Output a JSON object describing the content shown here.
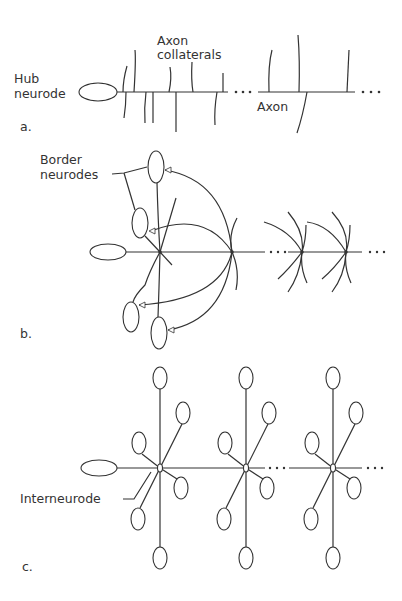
{
  "figure": {
    "panels": [
      {
        "id": "a",
        "label": "a.",
        "annotations": {
          "hub": [
            "Hub",
            "neurode"
          ],
          "collaterals": [
            "Axon",
            "collaterals"
          ],
          "axon": "Axon"
        }
      },
      {
        "id": "b",
        "label": "b.",
        "annotations": {
          "border": [
            "Border",
            "neurodes"
          ]
        }
      },
      {
        "id": "c",
        "label": "c.",
        "annotations": {
          "interneurode": "Interneurode"
        }
      }
    ],
    "colors": {
      "stroke": "#333333",
      "background": "#ffffff"
    }
  }
}
